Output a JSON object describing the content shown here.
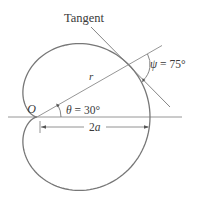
{
  "figure": {
    "curve": "r = a(1 + cos θ)",
    "labels": {
      "tangent": "Tangent",
      "origin": "O",
      "radius": "r",
      "theta_sym": "θ",
      "theta_eq": " = 30°",
      "psi_sym": "ψ",
      "psi_eq": " = 75°",
      "two": "2",
      "a": "a"
    },
    "values": {
      "theta_deg": 30,
      "psi_deg": 75
    },
    "colors": {
      "curve": "#777777",
      "lines": "#8a8a8a",
      "text": "#3a3a3a"
    }
  }
}
